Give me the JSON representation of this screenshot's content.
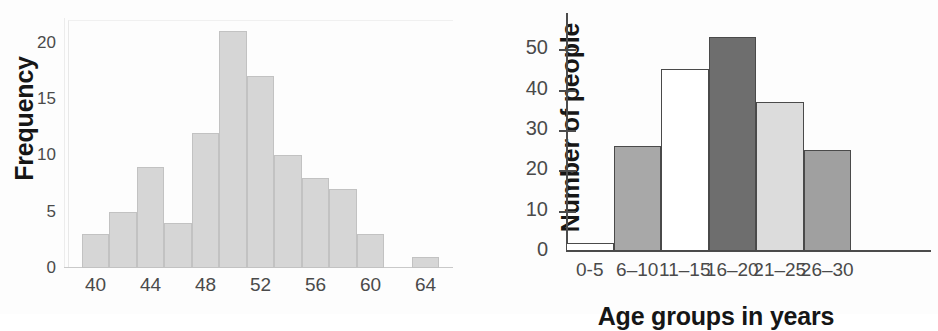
{
  "page": {
    "background": "#fdfdfd",
    "figure_count": 2
  },
  "chart_data": [
    {
      "id": "left-histogram",
      "type": "bar",
      "title": "",
      "subtitle": "",
      "xlabel": "",
      "ylabel": "Frequency",
      "grid": false,
      "legend": null,
      "xlim": [
        38,
        66
      ],
      "ylim": [
        0,
        22
      ],
      "xticks": [
        "40",
        "44",
        "48",
        "52",
        "56",
        "60",
        "64"
      ],
      "xtick_values": [
        40,
        44,
        48,
        52,
        56,
        60,
        64
      ],
      "yticks": [
        "0",
        "5",
        "10",
        "15",
        "20"
      ],
      "ytick_values": [
        0,
        5,
        10,
        15,
        20
      ],
      "bin_width": 2,
      "bin_starts": [
        39,
        41,
        43,
        45,
        47,
        49,
        51,
        53,
        55,
        57,
        59,
        63
      ],
      "categories": [
        "39-41",
        "41-43",
        "43-45",
        "45-47",
        "47-49",
        "49-51",
        "51-53",
        "53-55",
        "55-57",
        "57-59",
        "59-61",
        "63-65"
      ],
      "values": [
        3,
        5,
        9,
        4,
        12,
        21,
        17,
        10,
        8,
        7,
        3,
        1
      ],
      "bar_fill": "#d6d6d6",
      "bar_stroke": "#c2c2c2"
    },
    {
      "id": "right-bar-chart",
      "type": "bar",
      "title": "",
      "subtitle": "",
      "xlabel": "Age groups in years",
      "ylabel": "Number of people",
      "grid": false,
      "legend": null,
      "ylim": [
        0,
        56
      ],
      "yticks": [
        "0",
        "10",
        "20",
        "30",
        "40",
        "50"
      ],
      "ytick_values": [
        0,
        10,
        20,
        30,
        40,
        50
      ],
      "categories": [
        "0-5",
        "6–10",
        "11–15",
        "16–20",
        "21–25",
        "26–30"
      ],
      "values": [
        2,
        26,
        45,
        53,
        37,
        25
      ],
      "bar_colors": [
        "#ffffff",
        "#a8a8a8",
        "#ffffff",
        "#6e6e6e",
        "#dcdcdc",
        "#a0a0a0"
      ],
      "bar_stroke": "#4a4a4a",
      "axis_color": "#4c4c4c"
    }
  ]
}
